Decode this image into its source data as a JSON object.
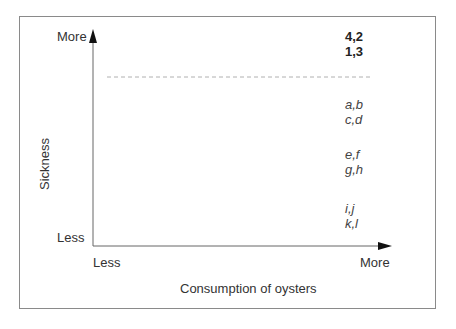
{
  "diagram": {
    "y_axis": {
      "title": "Sickness",
      "top_label": "More",
      "bottom_label": "Less"
    },
    "x_axis": {
      "title": "Consumption of oysters",
      "left_label": "Less",
      "right_label": "More"
    },
    "groups": [
      {
        "lines": [
          "4,2",
          "1,3"
        ],
        "style": "bold"
      },
      {
        "lines": [
          "a,b",
          "c,d"
        ],
        "style": "italic"
      },
      {
        "lines": [
          "e,f",
          "g,h"
        ],
        "style": "italic"
      },
      {
        "lines": [
          "i,j",
          "k,l"
        ],
        "style": "italic"
      }
    ],
    "threshold_line": "dashed",
    "colors": {
      "axis": "#555555",
      "frame": "#8a8a8a",
      "dashed_line": "#b0b0b0"
    }
  }
}
